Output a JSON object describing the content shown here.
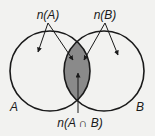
{
  "diagram": {
    "type": "venn",
    "sets": [
      {
        "id": "A",
        "label": "A",
        "count_label": "n(A)"
      },
      {
        "id": "B",
        "label": "B",
        "count_label": "n(B)"
      }
    ],
    "intersection": {
      "label": "n(A ∩ B)",
      "shaded": true
    },
    "colors": {
      "background": "#f2f2f0",
      "outline": "#1a1a1a",
      "intersection_fill": "#8a8a8a"
    }
  }
}
